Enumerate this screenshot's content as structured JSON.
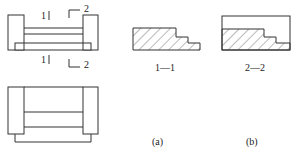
{
  "figure": {
    "plan_view": {
      "section_marks": [
        {
          "id": "1",
          "label": "1"
        },
        {
          "id": "2",
          "label": "2"
        }
      ]
    },
    "sections": [
      {
        "id": "1-1",
        "label": "1—1",
        "caption": "(a)"
      },
      {
        "id": "2-2",
        "label": "2—2",
        "caption": "(b)"
      }
    ],
    "colors": {
      "line": "#333333",
      "hatch": "#555555",
      "background": "#ffffff"
    }
  }
}
